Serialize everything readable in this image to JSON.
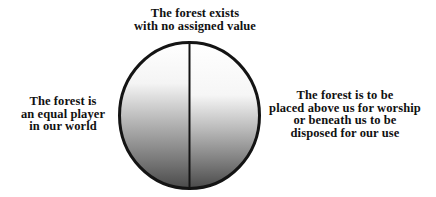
{
  "diagram": {
    "type": "circle-split-in-two-halves",
    "labels": {
      "top": {
        "lines": [
          "The forest exists",
          "with no assigned value"
        ]
      },
      "left": {
        "lines": [
          "The forest is",
          "an equal player",
          "in our world"
        ]
      },
      "right": {
        "lines": [
          "The forest is to be",
          "placed above us for worship",
          "or beneath us to be",
          "disposed for our use"
        ]
      }
    },
    "colors": {
      "stroke": "#141414",
      "gradient_top": "#ffffff",
      "gradient_bottom": "#4a4a4a",
      "text": "#111111",
      "background": "#ffffff"
    }
  }
}
